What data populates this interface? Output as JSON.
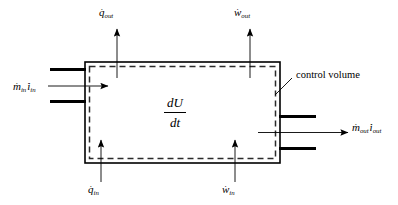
{
  "diagram": {
    "type": "thermodynamic-control-volume",
    "colors": {
      "line": "#000000",
      "dashed_boundary": "#333333",
      "background": "#ffffff"
    },
    "control_volume": {
      "label": "control volume",
      "solid_rect": {
        "x": 85,
        "y": 62,
        "width": 195,
        "height": 101
      },
      "dashed_rect": {
        "x": 89,
        "y": 66,
        "width": 187,
        "height": 93
      }
    },
    "storage_term": {
      "numerator": "dU",
      "denominator": "dt"
    },
    "flows": [
      {
        "name": "heat-out",
        "symbol": "q",
        "subscript": "out",
        "dot": true,
        "direction": "up",
        "side": "top",
        "label_x": 99,
        "label_y": 7
      },
      {
        "name": "work-out",
        "symbol": "w",
        "subscript": "out",
        "dot": true,
        "direction": "up",
        "side": "top",
        "label_x": 234,
        "label_y": 7
      },
      {
        "name": "heat-in",
        "symbol": "q",
        "subscript": "in",
        "dot": true,
        "direction": "up",
        "side": "bottom",
        "label_x": 88,
        "label_y": 184
      },
      {
        "name": "work-in",
        "symbol": "w",
        "subscript": "in",
        "dot": true,
        "direction": "up",
        "side": "bottom",
        "label_x": 222,
        "label_y": 184
      },
      {
        "name": "mass-inlet",
        "symbol": "m",
        "subscript": "in",
        "symbol2": "i",
        "subscript2": "in",
        "dot": true,
        "direction": "right",
        "side": "left",
        "label_x": 13,
        "label_y": 81
      },
      {
        "name": "mass-outlet",
        "symbol": "m",
        "subscript": "out",
        "symbol2": "i",
        "subscript2": "out",
        "dot": true,
        "direction": "right",
        "side": "right",
        "label_x": 352,
        "label_y": 122
      }
    ]
  }
}
